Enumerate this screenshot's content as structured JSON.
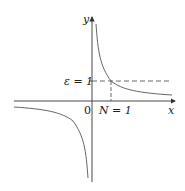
{
  "figure": {
    "axes": {
      "x_label": "x",
      "y_label": "y",
      "origin_label": "0"
    },
    "annotations": {
      "epsilon_label": "ε = 1",
      "N_label": "N = 1"
    },
    "colors": {
      "curve": "#555555",
      "axes": "#333333",
      "dashed": "#444444"
    }
  }
}
